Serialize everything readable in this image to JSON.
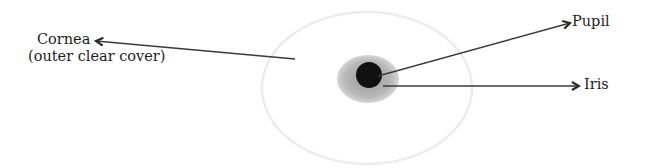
{
  "diagram": {
    "labels": {
      "cornea": {
        "line1": "Cornea",
        "line2": "(outer clear cover)"
      },
      "pupil": "Pupil",
      "iris": "Iris"
    },
    "colors": {
      "background": "#ffffff",
      "cornea_outline": "#ececec",
      "iris_fill": "#b4b4b4",
      "pupil_fill": "#111111",
      "arrow": "#3a3a3a",
      "text": "#1e1e1e"
    },
    "shapes": {
      "cornea": {
        "cx": 367,
        "cy": 88,
        "rx": 105,
        "ry": 76
      },
      "iris": {
        "cx": 368,
        "cy": 79,
        "rx": 31,
        "ry": 24
      },
      "pupil": {
        "cx": 369,
        "cy": 75,
        "r": 13
      }
    },
    "arrows": [
      {
        "name": "cornea-arrow",
        "from": [
          295,
          59
        ],
        "to": [
          95,
          41
        ]
      },
      {
        "name": "pupil-arrow",
        "from": [
          378,
          76
        ],
        "to": [
          570,
          23
        ]
      },
      {
        "name": "iris-arrow",
        "from": [
          383,
          86
        ],
        "to": [
          579,
          86
        ]
      }
    ]
  }
}
